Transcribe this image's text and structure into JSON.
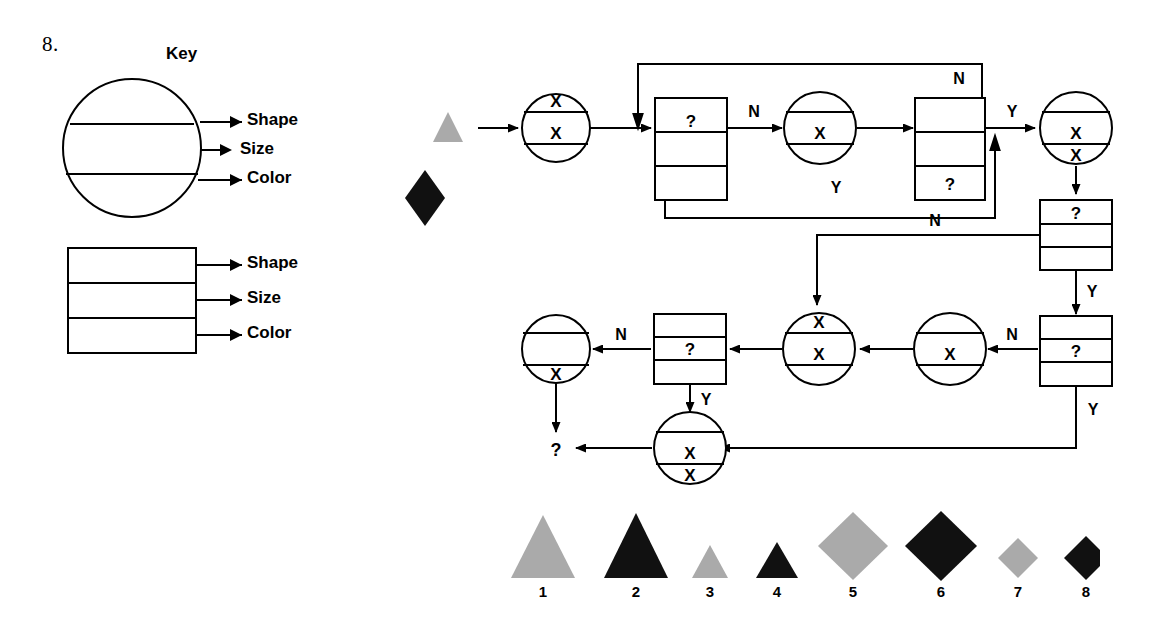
{
  "question_number": "8.",
  "key": {
    "title": "Key",
    "circle_labels": [
      "Shape",
      "Size",
      "Color"
    ],
    "box_labels": [
      "Shape",
      "Size",
      "Color"
    ]
  },
  "flowchart": {
    "input_shapes": [
      {
        "name": "input-triangle",
        "shape": "triangle",
        "size": "small",
        "color": "gray"
      },
      {
        "name": "input-diamond",
        "shape": "diamond",
        "size": "large",
        "color": "black"
      }
    ],
    "nodes": [
      {
        "id": "c1",
        "type": "circle",
        "bands": [
          "X",
          "X",
          ""
        ]
      },
      {
        "id": "b1",
        "type": "box",
        "bands": [
          "",
          "?",
          ""
        ]
      },
      {
        "id": "c2",
        "type": "circle",
        "bands": [
          "",
          "X",
          ""
        ]
      },
      {
        "id": "b2",
        "type": "box",
        "bands": [
          "",
          "",
          "?"
        ]
      },
      {
        "id": "c3",
        "type": "circle",
        "bands": [
          "",
          "X",
          "X"
        ]
      },
      {
        "id": "b3",
        "type": "box",
        "bands": [
          "?",
          "",
          ""
        ]
      },
      {
        "id": "b4",
        "type": "box",
        "bands": [
          "",
          "?",
          ""
        ]
      },
      {
        "id": "c4",
        "type": "circle",
        "bands": [
          "",
          "X",
          ""
        ]
      },
      {
        "id": "c5",
        "type": "circle",
        "bands": [
          "X",
          "X",
          ""
        ]
      },
      {
        "id": "b5",
        "type": "box",
        "bands": [
          "",
          "?",
          ""
        ]
      },
      {
        "id": "c6",
        "type": "circle",
        "bands": [
          "",
          "",
          "X"
        ]
      },
      {
        "id": "c7",
        "type": "circle",
        "bands": [
          "",
          "X",
          "X"
        ]
      }
    ],
    "edge_labels": [
      "N",
      "Y",
      "N",
      "Y",
      "N",
      "Y",
      "N",
      "Y",
      "N",
      "Y"
    ],
    "output_label": "?"
  },
  "answer_shapes": [
    {
      "number": "1",
      "shape": "triangle",
      "size": "large",
      "color": "gray"
    },
    {
      "number": "2",
      "shape": "triangle",
      "size": "large",
      "color": "black"
    },
    {
      "number": "3",
      "shape": "triangle",
      "size": "small",
      "color": "gray"
    },
    {
      "number": "4",
      "shape": "triangle",
      "size": "small",
      "color": "black"
    },
    {
      "number": "5",
      "shape": "diamond",
      "size": "large",
      "color": "gray"
    },
    {
      "number": "6",
      "shape": "diamond",
      "size": "large",
      "color": "black"
    },
    {
      "number": "7",
      "shape": "diamond",
      "size": "small",
      "color": "gray"
    },
    {
      "number": "8",
      "shape": "diamond",
      "size": "small",
      "color": "black"
    }
  ],
  "colors": {
    "gray": "#aaaaaa",
    "black": "#111111",
    "stroke": "#000000"
  }
}
